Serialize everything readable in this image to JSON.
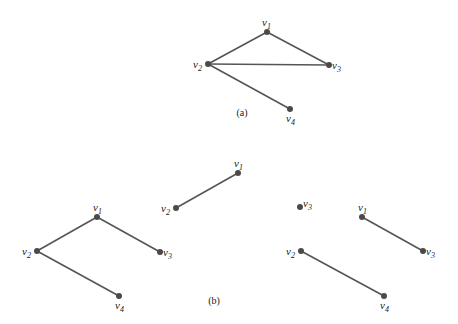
{
  "figure": {
    "graph_a": {
      "caption": "(a)",
      "caption_pos": [
        242,
        116
      ],
      "nodes": [
        {
          "id": "v1",
          "name": "v",
          "sub": "1",
          "x": 267,
          "y": 32,
          "lx": 262,
          "ly": 26
        },
        {
          "id": "v2",
          "name": "v",
          "sub": "2",
          "x": 208,
          "y": 64,
          "lx": 193,
          "ly": 68
        },
        {
          "id": "v3",
          "name": "v",
          "sub": "3",
          "x": 329,
          "y": 65,
          "lx": 332,
          "ly": 69
        },
        {
          "id": "v4",
          "name": "v",
          "sub": "4",
          "x": 290,
          "y": 109,
          "lx": 286,
          "ly": 122
        }
      ],
      "edges": [
        [
          "v1",
          "v2"
        ],
        [
          "v1",
          "v3"
        ],
        [
          "v2",
          "v3"
        ],
        [
          "v2",
          "v4"
        ]
      ]
    },
    "graph_b_caption": "(b)",
    "graph_b_caption_pos": [
      214,
      304
    ],
    "subgraphs_b": [
      {
        "nodes": [
          {
            "id": "v1",
            "name": "v",
            "sub": "1",
            "x": 97,
            "y": 217,
            "lx": 93,
            "ly": 211
          },
          {
            "id": "v2",
            "name": "v",
            "sub": "2",
            "x": 37,
            "y": 251,
            "lx": 22,
            "ly": 255
          },
          {
            "id": "v3",
            "name": "v",
            "sub": "3",
            "x": 160,
            "y": 252,
            "lx": 163,
            "ly": 256
          },
          {
            "id": "v4",
            "name": "v",
            "sub": "4",
            "x": 119,
            "y": 296,
            "lx": 115,
            "ly": 309
          }
        ],
        "edges": [
          [
            "v1",
            "v2"
          ],
          [
            "v1",
            "v3"
          ],
          [
            "v2",
            "v4"
          ]
        ]
      },
      {
        "nodes": [
          {
            "id": "v1",
            "name": "v",
            "sub": "1",
            "x": 238,
            "y": 173,
            "lx": 234,
            "ly": 167
          },
          {
            "id": "v2",
            "name": "v",
            "sub": "2",
            "x": 176,
            "y": 208,
            "lx": 161,
            "ly": 212
          }
        ],
        "edges": [
          [
            "v1",
            "v2"
          ]
        ]
      },
      {
        "nodes": [
          {
            "id": "v3",
            "name": "v",
            "sub": "3",
            "x": 300,
            "y": 207,
            "lx": 303,
            "ly": 207
          }
        ],
        "edges": []
      },
      {
        "nodes": [
          {
            "id": "v1",
            "name": "v",
            "sub": "1",
            "x": 362,
            "y": 217,
            "lx": 358,
            "ly": 211
          },
          {
            "id": "v3",
            "name": "v",
            "sub": "3",
            "x": 423,
            "y": 251,
            "lx": 426,
            "ly": 255
          }
        ],
        "edges": [
          [
            "v1",
            "v3"
          ]
        ]
      },
      {
        "nodes": [
          {
            "id": "v2",
            "name": "v",
            "sub": "2",
            "x": 301,
            "y": 251,
            "lx": 286,
            "ly": 255
          },
          {
            "id": "v4",
            "name": "v",
            "sub": "4",
            "x": 384,
            "y": 296,
            "lx": 380,
            "ly": 309
          }
        ],
        "edges": [
          [
            "v2",
            "v4"
          ]
        ]
      }
    ]
  }
}
